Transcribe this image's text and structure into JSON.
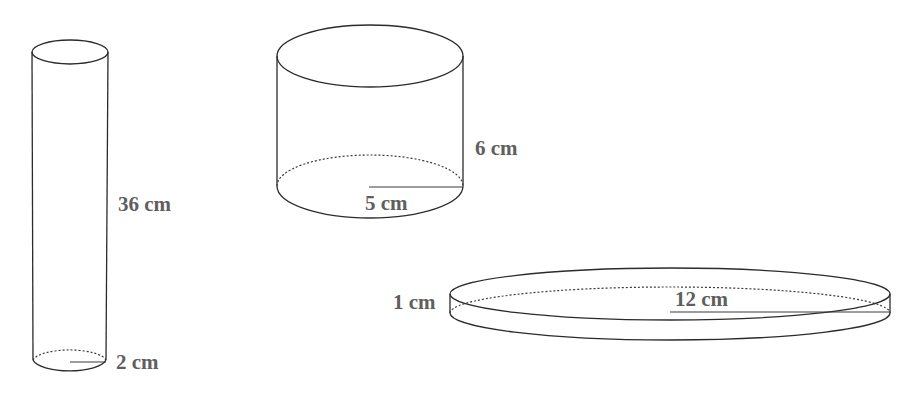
{
  "diagram": {
    "title": "",
    "cylinders": [
      {
        "id": "tall",
        "height_label": "36 cm",
        "radius_label": "2 cm",
        "height_cm": 36,
        "radius_cm": 2
      },
      {
        "id": "medium",
        "height_label": "6 cm",
        "radius_label": "5 cm",
        "height_cm": 6,
        "radius_cm": 5
      },
      {
        "id": "flat",
        "height_label": "1 cm",
        "radius_label": "12 cm",
        "height_cm": 1,
        "radius_cm": 12
      }
    ],
    "colors": {
      "stroke": "#2b2b2b",
      "label": "#5f5f5f",
      "background": "#ffffff"
    }
  }
}
